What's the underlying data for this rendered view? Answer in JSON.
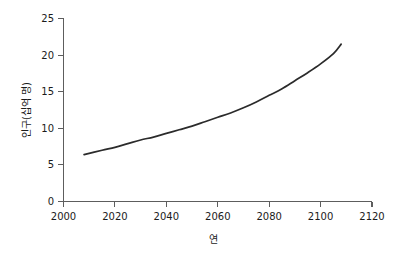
{
  "chart_data": {
    "type": "line",
    "title": "",
    "subtitle": "",
    "xlabel": "연",
    "ylabel": "인구(십억 명)",
    "xlim": [
      2000,
      2120
    ],
    "ylim": [
      0,
      25
    ],
    "xticks": [
      2000,
      2020,
      2040,
      2060,
      2080,
      2100,
      2120
    ],
    "xtick_labels": [
      "2000",
      "2020",
      "2040",
      "2060",
      "2080",
      "2100",
      "2120"
    ],
    "yticks": [
      0,
      5,
      10,
      15,
      20,
      25
    ],
    "ytick_labels": [
      "0",
      "5",
      "10",
      "15",
      "20",
      "25"
    ],
    "grid": false,
    "legend": null,
    "legend_position": "none",
    "annotations": [],
    "series": [
      {
        "name": "세계 인구",
        "color": "#2b2b2b",
        "x": [
          2008,
          2015,
          2020,
          2025,
          2030,
          2035,
          2040,
          2045,
          2050,
          2055,
          2060,
          2065,
          2070,
          2075,
          2080,
          2085,
          2090,
          2095,
          2100,
          2105,
          2108
        ],
        "values": [
          6.4,
          7.0,
          7.4,
          7.9,
          8.4,
          8.8,
          9.3,
          9.8,
          10.3,
          10.9,
          11.5,
          12.1,
          12.8,
          13.6,
          14.5,
          15.4,
          16.5,
          17.6,
          18.8,
          20.2,
          21.5
        ]
      }
    ]
  },
  "axis": {
    "y_title": "인구(십억 명)",
    "x_title": "연"
  }
}
